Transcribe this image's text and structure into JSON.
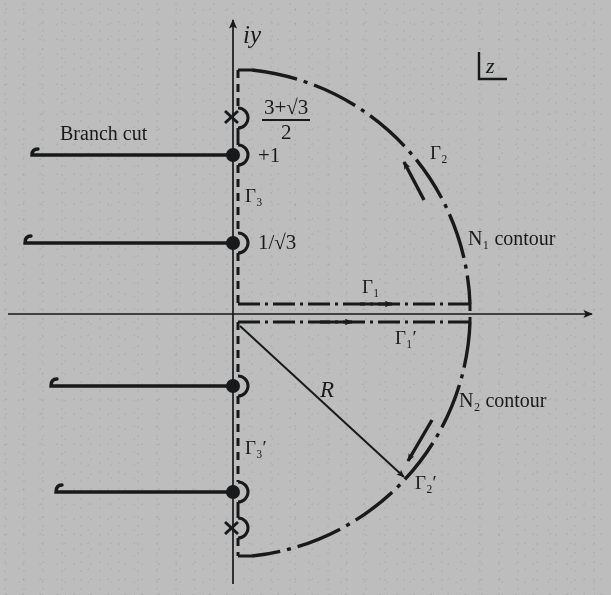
{
  "figure": {
    "plane_marker": "z",
    "axis_labels": {
      "imaginary": "iy",
      "real": ""
    },
    "annotations": {
      "branch_cut": "Branch cut",
      "radius": "R",
      "n1_contour": "N₁ contour",
      "n2_contour": "N₂ contour"
    },
    "axis_points": [
      {
        "name": "pole-upper",
        "marker": "x",
        "label_num": "3+√3",
        "label_den": "2"
      },
      {
        "name": "branch-point-upper",
        "marker": "dot",
        "label": "+1"
      },
      {
        "name": "branch-point-mid",
        "marker": "dot",
        "label": "1/√3"
      },
      {
        "name": "branch-point-lower",
        "marker": "dot",
        "label": ""
      },
      {
        "name": "pole-lower",
        "marker": "x",
        "label": ""
      }
    ],
    "contour_labels": {
      "gamma1": "Γ₁",
      "gamma1_prime": "Γ₁′",
      "gamma2": "Γ₂",
      "gamma2_prime": "Γ₂′",
      "gamma3": "Γ₃",
      "gamma3_prime": "Γ₃′"
    },
    "colors": {
      "ink": "#17191a",
      "paper": "#bdbdbd"
    }
  }
}
